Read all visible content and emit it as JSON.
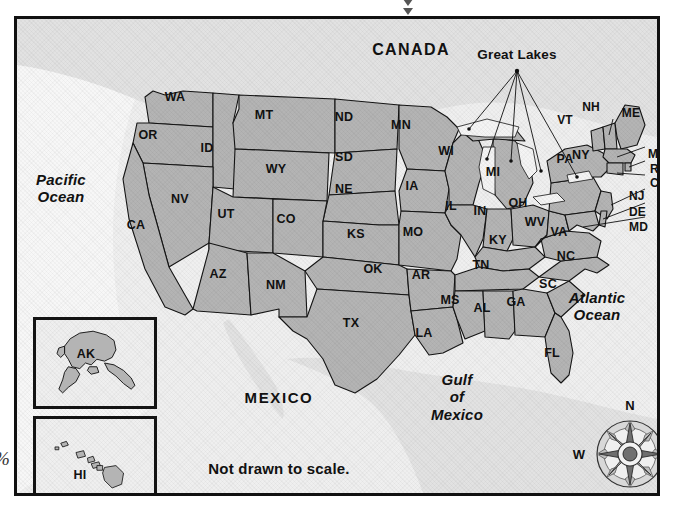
{
  "map": {
    "title_note": "Not drawn to scale.",
    "countries": [
      {
        "name": "CANADA",
        "x": 408,
        "y": 47
      },
      {
        "name": "MEXICO",
        "x": 276,
        "y": 394
      }
    ],
    "oceans": [
      {
        "name": "Pacific Ocean",
        "line1": "Pacific",
        "line2": "Ocean",
        "x": 48,
        "y": 182
      },
      {
        "name": "Atlantic Ocean",
        "line1": "Atlantic",
        "line2": "Ocean",
        "x": 594,
        "y": 300
      },
      {
        "name": "Gulf of Mexico",
        "line1": "Gulf",
        "line2": "of",
        "line3": "Mexico",
        "x": 454,
        "y": 390
      }
    ],
    "great_lakes_label": "Great Lakes",
    "partial_glyph": "%",
    "compass": {
      "north": "N",
      "south": "S",
      "east": "E",
      "west": "W"
    },
    "insets": [
      {
        "code": "AK",
        "name": "Alaska"
      },
      {
        "code": "HI",
        "name": "Hawaii"
      }
    ],
    "colors": {
      "state_fill": "#b4b4b4",
      "state_stroke": "#141414",
      "ocean_fill": "#efefef",
      "other_land": "#e2e2e2",
      "lake_fill": "#f4f4f4",
      "frame": "#111111",
      "text": "#111111"
    },
    "states": [
      {
        "code": "WA",
        "x": 172,
        "y": 94
      },
      {
        "code": "OR",
        "x": 145,
        "y": 132
      },
      {
        "code": "ID",
        "x": 204,
        "y": 145
      },
      {
        "code": "MT",
        "x": 261,
        "y": 112
      },
      {
        "code": "WY",
        "x": 273,
        "y": 166
      },
      {
        "code": "NV",
        "x": 177,
        "y": 196
      },
      {
        "code": "UT",
        "x": 223,
        "y": 211
      },
      {
        "code": "CA",
        "x": 133,
        "y": 222
      },
      {
        "code": "CO",
        "x": 283,
        "y": 216
      },
      {
        "code": "AZ",
        "x": 215,
        "y": 271
      },
      {
        "code": "NM",
        "x": 273,
        "y": 282
      },
      {
        "code": "ND",
        "x": 341,
        "y": 114
      },
      {
        "code": "SD",
        "x": 341,
        "y": 154
      },
      {
        "code": "NE",
        "x": 341,
        "y": 186
      },
      {
        "code": "KS",
        "x": 353,
        "y": 231
      },
      {
        "code": "OK",
        "x": 370,
        "y": 266
      },
      {
        "code": "TX",
        "x": 348,
        "y": 320
      },
      {
        "code": "MN",
        "x": 398,
        "y": 122
      },
      {
        "code": "IA",
        "x": 409,
        "y": 183
      },
      {
        "code": "MO",
        "x": 410,
        "y": 229
      },
      {
        "code": "AR",
        "x": 418,
        "y": 272
      },
      {
        "code": "LA",
        "x": 421,
        "y": 330
      },
      {
        "code": "WI",
        "x": 443,
        "y": 148
      },
      {
        "code": "IL",
        "x": 448,
        "y": 203
      },
      {
        "code": "MS",
        "x": 447,
        "y": 297
      },
      {
        "code": "IN",
        "x": 477,
        "y": 208
      },
      {
        "code": "MI",
        "x": 490,
        "y": 169
      },
      {
        "code": "KY",
        "x": 495,
        "y": 237
      },
      {
        "code": "TN",
        "x": 478,
        "y": 262
      },
      {
        "code": "AL",
        "x": 479,
        "y": 305
      },
      {
        "code": "OH",
        "x": 515,
        "y": 200
      },
      {
        "code": "WV",
        "x": 532,
        "y": 219
      },
      {
        "code": "VA",
        "x": 556,
        "y": 229
      },
      {
        "code": "NC",
        "x": 563,
        "y": 253
      },
      {
        "code": "SC",
        "x": 545,
        "y": 281
      },
      {
        "code": "GA",
        "x": 513,
        "y": 299
      },
      {
        "code": "FL",
        "x": 549,
        "y": 350
      },
      {
        "code": "PA",
        "x": 562,
        "y": 156
      },
      {
        "code": "NY",
        "x": 578,
        "y": 152
      },
      {
        "code": "VT",
        "x": 562,
        "y": 117
      },
      {
        "code": "NH",
        "x": 588,
        "y": 104
      },
      {
        "code": "ME",
        "x": 628,
        "y": 110
      },
      {
        "code": "MA",
        "x": 652,
        "y": 151
      },
      {
        "code": "RI",
        "x": 654,
        "y": 166
      },
      {
        "code": "CT",
        "x": 654,
        "y": 180
      },
      {
        "code": "NJ",
        "x": 629,
        "y": 193
      },
      {
        "code": "DE",
        "x": 629,
        "y": 209
      },
      {
        "code": "MD",
        "x": 631,
        "y": 224
      }
    ]
  }
}
